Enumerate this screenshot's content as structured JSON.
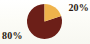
{
  "chart_data": {
    "type": "pie",
    "title": "",
    "subtitle": "",
    "xlabel": "",
    "ylabel": "",
    "grid": false,
    "legend_position": "none",
    "labels_inline": true,
    "total": 100,
    "units": "%",
    "start_angle_deg": 0,
    "direction": "clockwise",
    "categories": [
      "20%",
      "80%"
    ],
    "values": [
      20,
      80
    ],
    "slices": [
      {
        "label": "20%",
        "value": 20,
        "color": "#EFB34B",
        "start_angle_deg": 0,
        "end_angle_deg": 72,
        "label_position": "top-right"
      },
      {
        "label": "80%",
        "value": 80,
        "color": "#6C1F18",
        "start_angle_deg": 72,
        "end_angle_deg": 360,
        "label_position": "bottom-left"
      }
    ],
    "annotations": [
      "20%",
      "80%"
    ]
  },
  "style": {
    "background_color": "#FDFDFA",
    "label_text_color": "#2B1A10",
    "slice_accent_color": "#EFB34B",
    "slice_primary_color": "#6C1F18"
  },
  "geometry": {
    "center_x": 44.5,
    "center_y": 21.5,
    "radius": 17.5
  },
  "icons": {
    "pie_chart": "pie-chart-icon"
  }
}
